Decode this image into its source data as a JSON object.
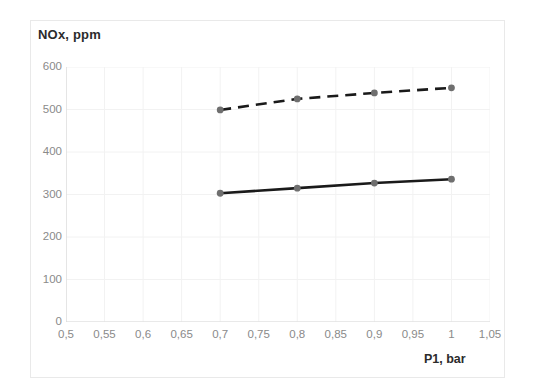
{
  "chart_data": {
    "type": "line",
    "title": "",
    "xlabel": "P1, bar",
    "ylabel": "NOx, ppm",
    "xlim": [
      0.5,
      1.05
    ],
    "ylim": [
      0,
      600
    ],
    "grid": true,
    "legend": "none",
    "x_tick_labels": [
      "0,5",
      "0,55",
      "0,6",
      "0,65",
      "0,7",
      "0,75",
      "0,8",
      "0,85",
      "0,9",
      "0,95",
      "1",
      "1,05"
    ],
    "x_tick_values": [
      0.5,
      0.55,
      0.6,
      0.65,
      0.7,
      0.75,
      0.8,
      0.85,
      0.9,
      0.95,
      1.0,
      1.05
    ],
    "y_tick_labels": [
      "600",
      "500",
      "400",
      "300",
      "200",
      "100",
      "0"
    ],
    "y_tick_values": [
      600,
      500,
      400,
      300,
      200,
      100,
      0
    ],
    "x": [
      0.7,
      0.8,
      0.9,
      1.0
    ],
    "series": [
      {
        "name": "upper-dashed-series",
        "style": "dashed",
        "color": "#1a1a1a",
        "marker": "circle",
        "marker_color": "#6f6f6f",
        "values": [
          499,
          525,
          539,
          551
        ]
      },
      {
        "name": "lower-solid-series",
        "style": "solid",
        "color": "#1a1a1a",
        "marker": "circle",
        "marker_color": "#6f6f6f",
        "values": [
          303,
          315,
          327,
          336
        ]
      }
    ],
    "colors": {
      "line": "#1a1a1a",
      "marker": "#6f6f6f",
      "grid": "#f2f2f2",
      "axis": "#d9d9d9",
      "tick_label": "#8a8a8a",
      "axis_title": "#2b2b2b",
      "frame": "#e9e9e9",
      "background": "#ffffff"
    }
  }
}
